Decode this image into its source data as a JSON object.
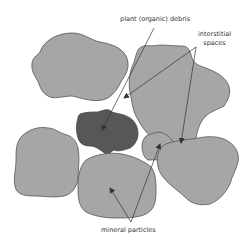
{
  "diagram": {
    "labels": {
      "organic_debris": "plant (organic) debris",
      "interstitial_line1": "interstitial",
      "interstitial_line2": "spaces",
      "mineral_particles": "mineral particles"
    },
    "colors": {
      "background": "#ffffff",
      "mineral_fill": "#a6a6a6",
      "organic_fill": "#575757",
      "outline": "#555555",
      "arrow": "#333333",
      "text": "#333333"
    },
    "elements": [
      {
        "type": "mineral-particle",
        "position": "top-left"
      },
      {
        "type": "mineral-particle",
        "position": "top-right"
      },
      {
        "type": "mineral-particle",
        "position": "left"
      },
      {
        "type": "organic-debris",
        "position": "center-left"
      },
      {
        "type": "mineral-particle",
        "position": "center-small"
      },
      {
        "type": "mineral-particle",
        "position": "bottom-center"
      },
      {
        "type": "mineral-particle",
        "position": "bottom-right"
      }
    ]
  }
}
